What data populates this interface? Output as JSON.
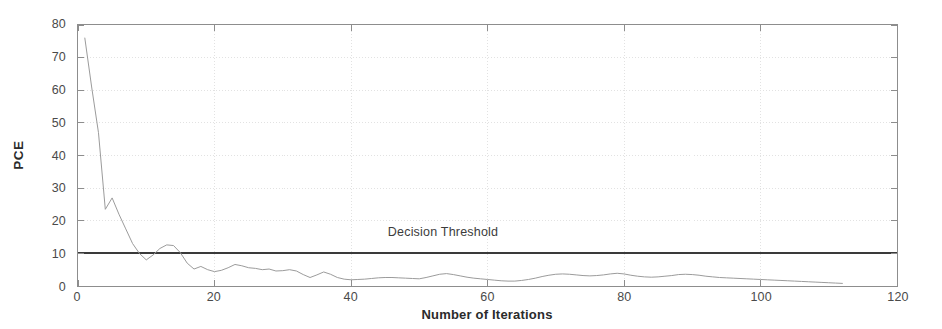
{
  "figure": {
    "background_color": "#ffffff",
    "axis_color": "#8d8d8d",
    "grid_color": "#e2e2e2",
    "series_color": "#9a9a9a",
    "threshold_color": "#3a3a3a",
    "text_color": "#3a3a3a"
  },
  "chart_data": {
    "type": "line",
    "title": "",
    "xlabel": "Number of Iterations",
    "ylabel": "PCE",
    "xlim": [
      0,
      120
    ],
    "ylim": [
      0,
      80
    ],
    "xticks": [
      0,
      20,
      40,
      60,
      80,
      100,
      120
    ],
    "yticks": [
      0,
      10,
      20,
      30,
      40,
      50,
      60,
      70,
      80
    ],
    "grid": true,
    "legend": false,
    "annotations": [
      {
        "text": "Decision Threshold",
        "x": 53,
        "y": 14.5,
        "type": "text"
      }
    ],
    "reference_lines": [
      {
        "name": "decision-threshold",
        "orientation": "horizontal",
        "value": 10,
        "label": "Decision Threshold",
        "color": "#3a3a3a",
        "width": 2.2
      }
    ],
    "series": [
      {
        "name": "PCE",
        "color": "#9a9a9a",
        "x": [
          1,
          2,
          3,
          4,
          5,
          6,
          7,
          8,
          9,
          10,
          11,
          12,
          13,
          14,
          15,
          16,
          17,
          18,
          19,
          20,
          21,
          22,
          23,
          24,
          25,
          26,
          27,
          28,
          29,
          30,
          31,
          32,
          33,
          34,
          35,
          36,
          37,
          38,
          39,
          40,
          41,
          42,
          43,
          44,
          45,
          46,
          47,
          48,
          49,
          50,
          51,
          52,
          53,
          54,
          55,
          56,
          57,
          58,
          59,
          60,
          61,
          62,
          63,
          64,
          65,
          66,
          67,
          68,
          69,
          70,
          71,
          72,
          73,
          74,
          75,
          76,
          77,
          78,
          79,
          80,
          81,
          82,
          83,
          84,
          85,
          86,
          87,
          88,
          89,
          90,
          91,
          92,
          93,
          94,
          95,
          96,
          97,
          98,
          99,
          100,
          101,
          102,
          103,
          104,
          105,
          106,
          107,
          108,
          109,
          110,
          111,
          112
        ],
        "values": [
          76.0,
          61.0,
          47.0,
          23.5,
          27.0,
          22.0,
          17.5,
          13.0,
          10.0,
          8.0,
          9.5,
          11.5,
          12.6,
          12.4,
          10.2,
          7.0,
          5.2,
          6.0,
          5.0,
          4.4,
          4.8,
          5.6,
          6.6,
          6.2,
          5.6,
          5.4,
          5.0,
          5.2,
          4.6,
          4.7,
          5.0,
          4.6,
          3.5,
          2.6,
          3.4,
          4.3,
          3.6,
          2.6,
          2.1,
          1.9,
          2.0,
          2.1,
          2.3,
          2.5,
          2.6,
          2.6,
          2.5,
          2.4,
          2.3,
          2.2,
          2.6,
          3.1,
          3.6,
          3.8,
          3.5,
          3.1,
          2.7,
          2.4,
          2.2,
          2.0,
          1.8,
          1.6,
          1.5,
          1.5,
          1.7,
          2.0,
          2.4,
          2.9,
          3.3,
          3.6,
          3.7,
          3.6,
          3.4,
          3.2,
          3.1,
          3.2,
          3.4,
          3.7,
          3.9,
          3.7,
          3.3,
          3.0,
          2.8,
          2.7,
          2.8,
          3.0,
          3.2,
          3.5,
          3.6,
          3.5,
          3.3,
          3.0,
          2.8,
          2.6,
          2.5,
          2.4,
          2.3,
          2.2,
          2.1,
          2.0,
          1.9,
          1.8,
          1.7,
          1.6,
          1.5,
          1.4,
          1.3,
          1.2,
          1.1,
          1.0,
          0.9,
          0.8
        ]
      }
    ]
  }
}
